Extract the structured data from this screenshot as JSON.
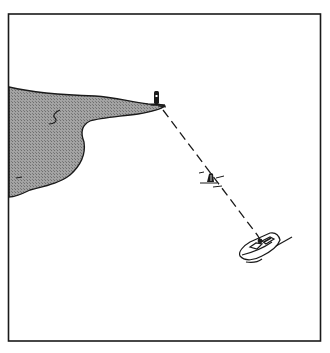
{
  "figure": {
    "type": "line-illustration",
    "colors": {
      "background": "#ffffff",
      "ink": "#1a1a1a",
      "land_fill": "#9a9a9a",
      "land_hatch": "#6e6e6e"
    },
    "frame": {
      "x": 8,
      "y": 14,
      "width": 313,
      "height": 327
    },
    "elements": {
      "headland": {
        "label": "land-mass"
      },
      "lighthouse": {
        "label": "lighthouse",
        "x": 156,
        "y": 98
      },
      "buoy": {
        "label": "buoy",
        "x": 210,
        "y": 179
      },
      "boat": {
        "label": "motor-boat",
        "x": 262,
        "y": 248
      },
      "transit_line": {
        "label": "dashed-bearing-line",
        "from": [
          163,
          110
        ],
        "to": [
          258,
          236
        ]
      }
    }
  }
}
